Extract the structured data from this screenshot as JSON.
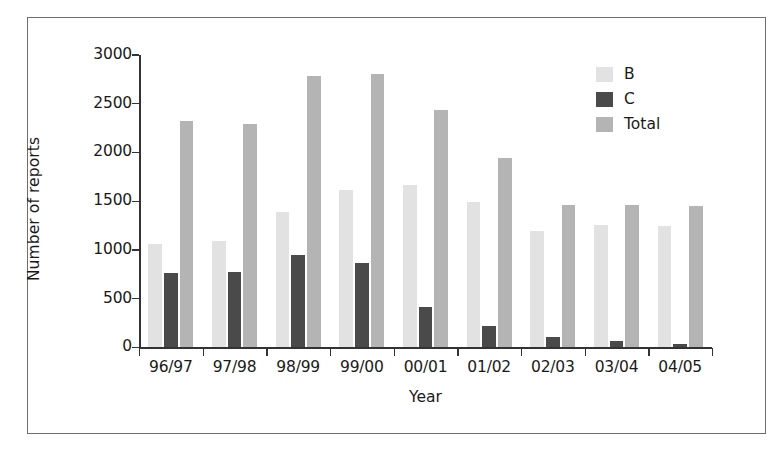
{
  "figure": {
    "frame_visible": true,
    "background_color": "#ffffff"
  },
  "chart_data": {
    "type": "bar",
    "title": "",
    "xlabel": "Year",
    "ylabel": "Number of reports",
    "categories": [
      "96/97",
      "97/98",
      "98/99",
      "99/00",
      "00/01",
      "01/02",
      "02/03",
      "03/04",
      "04/05"
    ],
    "series": [
      {
        "name": "B",
        "color": "#e2e2e2",
        "values": [
          1060,
          1090,
          1390,
          1610,
          1670,
          1495,
          1190,
          1255,
          1250
        ]
      },
      {
        "name": "C",
        "color": "#4a4a4a",
        "values": [
          760,
          770,
          950,
          870,
          410,
          215,
          110,
          70,
          40
        ]
      },
      {
        "name": "Total",
        "color": "#b4b4b4",
        "values": [
          2320,
          2290,
          2780,
          2800,
          2440,
          1940,
          1465,
          1460,
          1450
        ]
      }
    ],
    "ylim": [
      0,
      3000
    ],
    "y_ticks": [
      0,
      500,
      1000,
      1500,
      2000,
      2500,
      3000
    ],
    "y_tick_labels": [
      "0",
      "500",
      "1000",
      "1500",
      "2000",
      "2500",
      "3000"
    ],
    "grid": false,
    "legend_position": "top-right",
    "legend_entries": [
      "B",
      "C",
      "Total"
    ],
    "axis_color": "#333333"
  }
}
